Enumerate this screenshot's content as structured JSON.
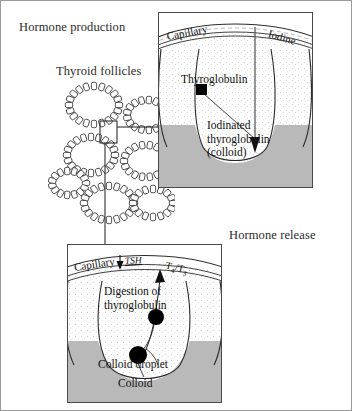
{
  "figure": {
    "title_production": "Hormone production",
    "title_release": "Hormone release",
    "label_follicles": "Thyroid follicles"
  },
  "panel_top": {
    "name": "hormone-production-detail",
    "capillary_label": "Capillary",
    "iodine_label": "Iodine",
    "thyroglobulin_label": "Thyroglobulin",
    "colloid_label": "Iodinated thyroglobulin (colloid)",
    "colloid_line1": "Iodinated",
    "colloid_line2": "thyroglobulin",
    "colloid_line3": "(colloid)"
  },
  "panel_bottom": {
    "name": "hormone-release-detail",
    "capillary_label": "Capillary",
    "tsh_label": "TSH",
    "t4t3_label": "T4/T3",
    "t4_base": "T",
    "t4_sub": "4",
    "slash": "/",
    "t3_base": "T",
    "t3_sub": "3",
    "digestion_line1": "Digestion of",
    "digestion_line2": "thyroglobulin",
    "colloid_droplet_label": "Colloid droplet",
    "colloid_label": "Colloid"
  },
  "colors": {
    "colloid_gray": "#b9b9b9",
    "stipple_gray": "#d7d7d7",
    "outline": "#3a3a3a",
    "marker_black": "#000000",
    "frame_border": "#9a9a9a"
  },
  "icons": {
    "thyroglobulin_marker": "black-square-marker",
    "colloid_droplet_marker": "black-circle-marker",
    "iodine_arrow": "down-arrow-icon",
    "tsh_arrow": "down-arrow-icon",
    "t4t3_arrow": "up-arrow-icon"
  }
}
